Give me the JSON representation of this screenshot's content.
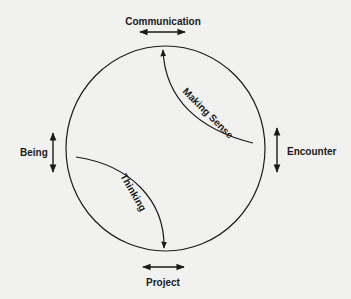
{
  "diagram": {
    "poles": {
      "top": "Communication",
      "left": "Being",
      "right": "Encounter",
      "bottom": "Project"
    },
    "arcs": {
      "upper": "Making Sense",
      "lower": "Thinking"
    },
    "colors": {
      "background": "#f1f1ef",
      "ink": "#1a1a1a"
    }
  }
}
